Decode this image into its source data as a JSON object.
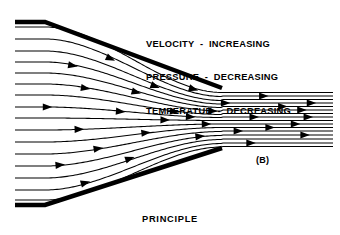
{
  "figure": {
    "caption": "PRINCIPLE",
    "panel_label": "(B)",
    "annotations": [
      "VELOCITY  -  INCREASING",
      "PRESSURE  -  DECREASING",
      "TEMPERATUE  -  DECREASING"
    ],
    "ink_color": "#000000",
    "background_color": "#ffffff"
  },
  "chart_data": {
    "type": "line",
    "title": "PRINCIPLE",
    "subtitle": "(B)",
    "xlabel": "",
    "ylabel": "",
    "xlim": [
      0,
      340
    ],
    "ylim": [
      235,
      0
    ],
    "grid": false,
    "legend": "none",
    "annotations": [
      "VELOCITY  -  INCREASING",
      "PRESSURE  -  DECREASING",
      "TEMPERATUE  -  DECREASING"
    ],
    "geometry": {
      "description": "convergent nozzle (venturi) with converging duct walls and a parallel exit jet",
      "inlet_x": 15,
      "flat_wall_end_x": 45,
      "throat_x": 222,
      "exit_x": 333,
      "top_wall_inlet_y": 22,
      "top_wall_throat_y": 88,
      "bottom_wall_inlet_y": 205,
      "bottom_wall_throat_y": 148,
      "wall_thickness": 4.5,
      "centerline_y": 117
    },
    "series": [
      {
        "name": "streamline-1",
        "inlet_y": 27,
        "throat_y": 92.5,
        "exit_y": 92.5,
        "arrows_t": [
          0.56
        ]
      },
      {
        "name": "streamline-2",
        "inlet_y": 39,
        "throat_y": 96.5,
        "exit_y": 96.0,
        "arrows_t": [
          0.3,
          0.78
        ]
      },
      {
        "name": "streamline-3",
        "inlet_y": 51,
        "throat_y": 100.5,
        "exit_y": 99.5,
        "arrows_t": [
          0.44
        ]
      },
      {
        "name": "streamline-4",
        "inlet_y": 62,
        "throat_y": 104.0,
        "exit_y": 103.0,
        "arrows_t": [
          0.18,
          0.66,
          0.93
        ]
      },
      {
        "name": "streamline-5",
        "inlet_y": 73,
        "throat_y": 107.5,
        "exit_y": 106.5,
        "arrows_t": [
          0.38,
          0.84
        ]
      },
      {
        "name": "streamline-6",
        "inlet_y": 84,
        "throat_y": 111.0,
        "exit_y": 110.0,
        "arrows_t": [
          0.22,
          0.62,
          0.9
        ]
      },
      {
        "name": "streamline-7",
        "inlet_y": 95,
        "throat_y": 114.5,
        "exit_y": 113.5,
        "arrows_t": [
          0.5
        ]
      },
      {
        "name": "streamline-8",
        "inlet_y": 107,
        "throat_y": 117.5,
        "exit_y": 117.0,
        "arrows_t": [
          0.1,
          0.33,
          0.55,
          0.75,
          0.92
        ]
      },
      {
        "name": "streamline-9",
        "inlet_y": 118,
        "throat_y": 120.5,
        "exit_y": 120.5,
        "arrows_t": [
          0.47
        ]
      },
      {
        "name": "streamline-10",
        "inlet_y": 130,
        "throat_y": 124.0,
        "exit_y": 124.0,
        "arrows_t": [
          0.2,
          0.6,
          0.88
        ]
      },
      {
        "name": "streamline-11",
        "inlet_y": 142,
        "throat_y": 127.5,
        "exit_y": 127.5,
        "arrows_t": [
          0.41,
          0.8
        ]
      },
      {
        "name": "streamline-12",
        "inlet_y": 154,
        "throat_y": 131.5,
        "exit_y": 131.0,
        "arrows_t": [
          0.26,
          0.7
        ]
      },
      {
        "name": "streamline-13",
        "inlet_y": 166,
        "throat_y": 135.5,
        "exit_y": 135.0,
        "arrows_t": [
          0.14,
          0.58,
          0.91
        ]
      },
      {
        "name": "streamline-14",
        "inlet_y": 178,
        "throat_y": 139.5,
        "exit_y": 139.0,
        "arrows_t": [
          0.36
        ]
      },
      {
        "name": "streamline-15",
        "inlet_y": 190,
        "throat_y": 143.5,
        "exit_y": 143.0,
        "arrows_t": [
          0.22,
          0.74
        ]
      },
      {
        "name": "streamline-16",
        "inlet_y": 200,
        "throat_y": 147.0,
        "exit_y": 146.5,
        "arrows_t": []
      }
    ]
  }
}
